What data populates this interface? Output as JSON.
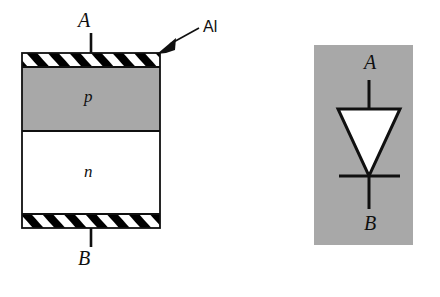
{
  "figure": {
    "background_color": "#ffffff",
    "ink_color": "#101010"
  },
  "cross_section": {
    "name": "pn-junction-cross-section",
    "terminal_top_label": "A",
    "terminal_bottom_label": "B",
    "layers": [
      {
        "name": "top-aluminium-contact",
        "label": "",
        "fill": "hatched",
        "fill_color": "#ffffff",
        "hatch_color": "#000000"
      },
      {
        "name": "p-region",
        "label": "p",
        "fill": "solid",
        "fill_color": "#a8a8a8"
      },
      {
        "name": "n-region",
        "label": "n",
        "fill": "solid",
        "fill_color": "#ffffff"
      },
      {
        "name": "bottom-aluminium-contact",
        "label": "",
        "fill": "hatched",
        "fill_color": "#ffffff",
        "hatch_color": "#000000"
      }
    ],
    "callout": {
      "label": "Al",
      "points_to": "top-aluminium-contact"
    }
  },
  "symbol": {
    "name": "diode-circuit-symbol",
    "panel_color": "#a8a8a8",
    "anode_label": "A",
    "cathode_label": "B",
    "body_fill": "#ffffff",
    "body_stroke": "#101010"
  }
}
